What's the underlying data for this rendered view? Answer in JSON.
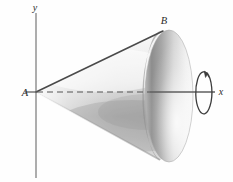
{
  "figure": {
    "background_color": "#fefefe",
    "width": 233,
    "height": 182
  },
  "axes": {
    "x_axis": {
      "label": "x",
      "label_x": 221,
      "label_y": 95,
      "color": "#5a5a5a",
      "solid_from_x": 150,
      "solid_to_x": 215,
      "y": 92
    },
    "y_axis": {
      "label": "y",
      "label_x": 35,
      "label_y": 11,
      "color": "#7d7d7d",
      "x": 36,
      "from_y": 13,
      "to_y": 178
    },
    "axis_of_revolution_dashed": {
      "name": "dashed-axis-segment",
      "from_x": 37,
      "to_x": 150,
      "y": 92,
      "color": "#555555"
    }
  },
  "labels": {
    "apex": "A",
    "apex_x": 25,
    "apex_y": 96,
    "rim_top": "B",
    "rim_top_x": 164,
    "rim_top_y": 24
  },
  "cone": {
    "apex_point": [
      36,
      92
    ],
    "base_center": [
      169,
      96
    ],
    "base_rx": 24,
    "base_ry": 66,
    "slant_top_point": [
      163,
      31
    ],
    "slant_bottom_point": [
      160,
      160
    ],
    "outline_color": "#4a4a4a",
    "body_light": "#f2f2f2",
    "body_mid": "#c9c9c9",
    "body_shadow": "#9a9a9a",
    "base_dark": "#8e8e8e",
    "base_light": "#ededed"
  },
  "rotation_arrow": {
    "name": "revolution-arrow",
    "center_x": 203,
    "center_y": 92,
    "rx": 8,
    "ry": 21,
    "color": "#3d3d3d"
  },
  "colors": {
    "ink": "#2b2b2b",
    "axis_gray": "#6f6f6f",
    "outline": "#4a4a4a"
  }
}
